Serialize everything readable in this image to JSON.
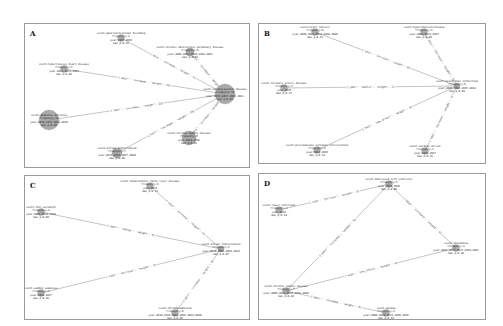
{
  "panels": [
    {
      "id": "A",
      "letter": "A",
      "box": {
        "x": 24,
        "y": 23,
        "w": 226,
        "h": 145
      },
      "nodes": [
        {
          "id": "a0",
          "x": 200,
          "y": 70,
          "r": 10,
          "lines": [
            "event:cardiovascular disease",
            "Frequency:12",
            "year:2015,2017,2019,2021",
            "max_p:0.03"
          ]
        },
        {
          "id": "a1",
          "x": 96,
          "y": 14,
          "r": 0,
          "lines": [
            "event:gastrointestinal bleeding",
            "Frequency:4",
            "year:2017,2019",
            "max_p:0.21"
          ]
        },
        {
          "id": "a2",
          "x": 165,
          "y": 28,
          "r": 4,
          "lines": [
            "event:chronic obstructive pulmonary disease",
            "Frequency:6",
            "year:2008,2012,2016,2018,2021",
            "max_p:0.14"
          ]
        },
        {
          "id": "a3",
          "x": 39,
          "y": 45,
          "r": 0,
          "lines": [
            "event:hypertensive heart disease",
            "Frequency:5",
            "year:2011,2013,2015",
            "max_p:0.08"
          ]
        },
        {
          "id": "a4",
          "x": 24,
          "y": 96,
          "r": 10,
          "lines": [
            "event:diabetes mellitus",
            "Frequency:14",
            "year:2010,2012,2014,2016",
            "max_p:0.02"
          ]
        },
        {
          "id": "a5",
          "x": 92,
          "y": 129,
          "r": 5,
          "lines": [
            "event:atrial fibrillation",
            "Frequency:7",
            "year:2011,2013,2017,2020",
            "max_p:0.06"
          ]
        },
        {
          "id": "a6",
          "x": 164,
          "y": 114,
          "r": 7,
          "lines": [
            "event:chronic kidney disease",
            "Frequency:9",
            "year:2014,2018",
            "max_p:0.05"
          ]
        }
      ],
      "edges": [
        {
          "from": "a1",
          "to": "a0",
          "label": "{'edit': 'increase', 'weight': 9}"
        },
        {
          "from": "a2",
          "to": "a0",
          "label": "{'edit': 'increase', 'weight': 6}"
        },
        {
          "from": "a3",
          "to": "a0",
          "label": "{'edit': 'increase', 'weight': 12}"
        },
        {
          "from": "a4",
          "to": "a0",
          "label": "{'edit': 'increase', 'weight': 23}"
        },
        {
          "from": "a5",
          "to": "a0",
          "label": "{'edit': 'increase', 'weight': 15}"
        },
        {
          "from": "a6",
          "to": "a0",
          "label": "{'edit': 'increase', 'weight': 7}"
        }
      ]
    },
    {
      "id": "B",
      "letter": "B",
      "box": {
        "x": 258,
        "y": 23,
        "w": 228,
        "h": 141
      },
      "nodes": [
        {
          "id": "b0",
          "x": 198,
          "y": 62,
          "r": 3,
          "lines": [
            "event:myocardial infarction",
            "Frequency:9",
            "year:2009,2011,2015,2018",
            "max_p:0.04"
          ]
        },
        {
          "id": "b1",
          "x": 56,
          "y": 8,
          "r": 0,
          "lines": [
            "event:heart failure",
            "Frequency:6",
            "year:2010,2012,2014,2016,2020",
            "max_p:0.11"
          ]
        },
        {
          "id": "b2",
          "x": 165,
          "y": 8,
          "r": 0,
          "lines": [
            "event:hypercholesterolemia",
            "Frequency:5",
            "year:2008,2013,2017",
            "max_p:0.09"
          ]
        },
        {
          "id": "b3",
          "x": 25,
          "y": 64,
          "r": 0,
          "lines": [
            "event:coronary artery disease",
            "Frequency:3",
            "year:2016",
            "max_p:0.17"
          ]
        },
        {
          "id": "b4",
          "x": 58,
          "y": 126,
          "r": 0,
          "lines": [
            "event:percutaneous coronary intervention",
            "Frequency:4",
            "year:2012,2019",
            "max_p:0.12"
          ]
        },
        {
          "id": "b5",
          "x": 166,
          "y": 127,
          "r": 0,
          "lines": [
            "event:cardiac arrest",
            "Frequency:3",
            "year:2014,2017",
            "max_p:0.15"
          ]
        }
      ],
      "edges": [
        {
          "from": "b1",
          "to": "b0",
          "label": "{'edit': 'increase', 'weight': 8}"
        },
        {
          "from": "b2",
          "to": "b0",
          "label": "{'edit': 'increase', 'weight': 5}"
        },
        {
          "from": "b3",
          "to": "b0",
          "label": "{'edit': 'hatter', 'weight': 3}"
        },
        {
          "from": "b4",
          "to": "b0",
          "label": "{'edit': 'new_effect', 'weight': 4}"
        },
        {
          "from": "b5",
          "to": "b0",
          "label": "{'edit': 'increase', 'weight': 3}"
        }
      ]
    },
    {
      "id": "C",
      "letter": "C",
      "box": {
        "x": 24,
        "y": 175,
        "w": 226,
        "h": 145
      },
      "nodes": [
        {
          "id": "c0",
          "x": 196,
          "y": 73,
          "r": 3,
          "lines": [
            "event:atrial fibrillation",
            "Frequency:5",
            "year:2011,2013,2016,2019",
            "max_p:0.07"
          ]
        },
        {
          "id": "c1",
          "x": 125,
          "y": 10,
          "r": 0,
          "lines": [
            "event:nonalcoholic fatty liver disease",
            "Frequency:4",
            "year:2015",
            "max_p:0.13"
          ]
        },
        {
          "id": "c2",
          "x": 16,
          "y": 36,
          "r": 0,
          "lines": [
            "event:fall accident",
            "Frequency:4",
            "year:2008,2012,2018",
            "max_p:0.09"
          ]
        },
        {
          "id": "c3",
          "x": 16,
          "y": 117,
          "r": 0,
          "lines": [
            "event:sudden weakness",
            "Frequency:3",
            "year:2014,2017",
            "max_p:0.16"
          ]
        },
        {
          "id": "c4",
          "x": 150,
          "y": 137,
          "r": 0,
          "lines": [
            "event:thromboembolism",
            "Frequency:6",
            "year:2010,2012,2014,2016,2018,2020",
            "max_p:0.05"
          ]
        }
      ],
      "edges": [
        {
          "from": "c1",
          "to": "c0",
          "label": "{'edit': 'increase', 'weight': 4}"
        },
        {
          "from": "c2",
          "to": "c0",
          "label": "{'edit': 'hatter', 'weight': 4}"
        },
        {
          "from": "c3",
          "to": "c0",
          "label": "{'edit': 'decrease', 'weight': 3}"
        },
        {
          "from": "c4",
          "to": "c0",
          "label": "{'edit': 'increase', 'weight': 6}"
        }
      ]
    },
    {
      "id": "D",
      "letter": "D",
      "box": {
        "x": 258,
        "y": 173,
        "w": 228,
        "h": 147
      },
      "nodes": [
        {
          "id": "d0",
          "x": 130,
          "y": 10,
          "r": 0,
          "lines": [
            "event:depressed left ventricle",
            "Frequency:5",
            "year:2013,2016",
            "max_p:0.08"
          ]
        },
        {
          "id": "d1",
          "x": 20,
          "y": 36,
          "r": 0,
          "lines": [
            "event:lower infection",
            "Frequency:3",
            "year:2015",
            "max_p:0.14"
          ]
        },
        {
          "id": "d2",
          "x": 197,
          "y": 74,
          "r": 0,
          "lines": [
            "event:pneumonia",
            "Frequency:4",
            "year:2011,2014,2017,2019,2021",
            "max_p:0.10"
          ]
        },
        {
          "id": "d3",
          "x": 27,
          "y": 117,
          "r": 0,
          "lines": [
            "event:chronic kidney disease",
            "Frequency:7",
            "year:2009,2012,2015,2018,2020",
            "max_p:0.04"
          ]
        },
        {
          "id": "d4",
          "x": 127,
          "y": 139,
          "r": 0,
          "lines": [
            "event:anemia",
            "Frequency:4",
            "year:2008,2010,2013,2016,2019",
            "max_p:0.12"
          ]
        }
      ],
      "edges": [
        {
          "from": "d1",
          "to": "d0",
          "label": "{'edit': 'increase', 'weight': 3}"
        },
        {
          "from": "d3",
          "to": "d0",
          "label": "{'edit': 'increase', 'weight': 5}"
        },
        {
          "from": "d0",
          "to": "d2",
          "label": "{'edit': 'increase', 'weight': 4}"
        },
        {
          "from": "d3",
          "to": "d2",
          "label": "{'edit': 'new_effect', 'weight': 4}"
        },
        {
          "from": "d3",
          "to": "d4",
          "label": "{'edit': 'increase', 'weight': 3}"
        }
      ]
    }
  ]
}
